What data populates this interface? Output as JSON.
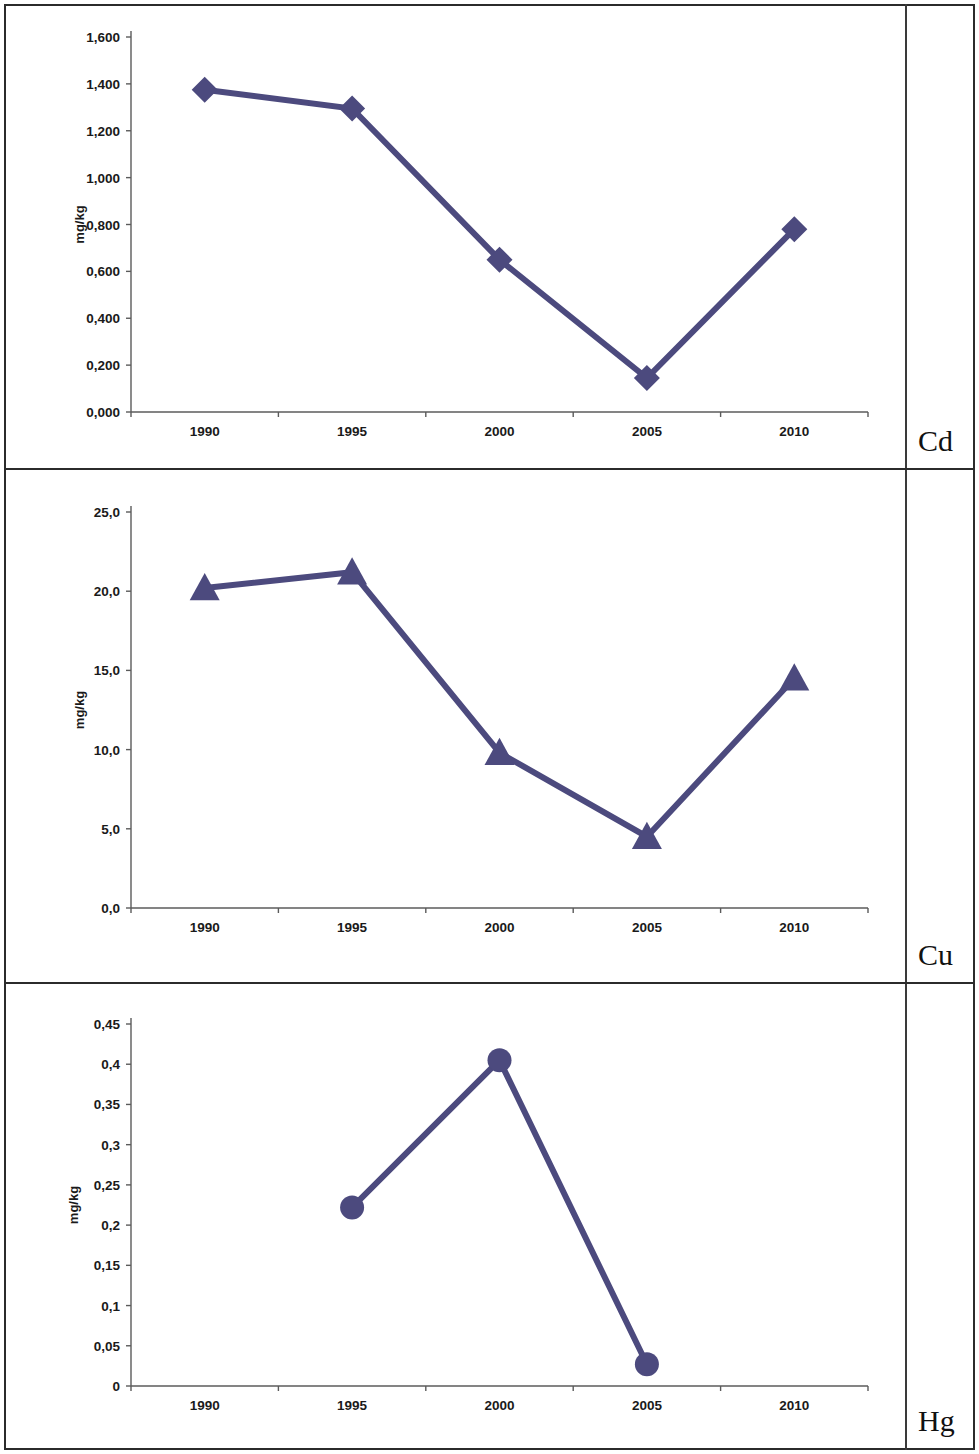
{
  "layout": {
    "accent_color": "#4c4a7e",
    "axis_color": "#5b5b5b",
    "border_color": "#2b2b2b",
    "row_labels": [
      {
        "name": "Cd"
      },
      {
        "name": "Cu"
      },
      {
        "name": "Hg"
      }
    ]
  },
  "chart_data": [
    {
      "type": "line",
      "title": "",
      "element": "Cd",
      "xlabel": "",
      "ylabel": "mg/kg",
      "marker": "diamond",
      "categories": [
        "1990",
        "1995",
        "2000",
        "2005",
        "2010"
      ],
      "x_ticklabels": [
        "1990",
        "1995",
        "2000",
        "2005",
        "2010"
      ],
      "y_ticklabels": [
        "0,000",
        "0,200",
        "0,400",
        "0,600",
        "0,800",
        "1,000",
        "1,200",
        "1,400",
        "1,600"
      ],
      "ylim": [
        0,
        1.6
      ],
      "ytick_step": 0.2,
      "values": [
        1.375,
        1.295,
        0.65,
        0.145,
        0.78
      ],
      "grid": false,
      "legend": "none"
    },
    {
      "type": "line",
      "title": "",
      "element": "Cu",
      "xlabel": "",
      "ylabel": "mg/kg",
      "marker": "triangle",
      "categories": [
        "1990",
        "1995",
        "2000",
        "2005",
        "2010"
      ],
      "x_ticklabels": [
        "1990",
        "1995",
        "2000",
        "2005",
        "2010"
      ],
      "y_ticklabels": [
        "0,0",
        "5,0",
        "10,0",
        "15,0",
        "20,0",
        "25,0"
      ],
      "ylim": [
        0,
        25
      ],
      "ytick_step": 5,
      "values": [
        20.2,
        21.2,
        9.8,
        4.5,
        14.5
      ],
      "grid": false,
      "legend": "none"
    },
    {
      "type": "line",
      "title": "",
      "element": "Hg",
      "xlabel": "",
      "ylabel": "mg/kg",
      "marker": "circle",
      "categories": [
        "1990",
        "1995",
        "2000",
        "2005",
        "2010"
      ],
      "x_ticklabels": [
        "1990",
        "1995",
        "2000",
        "2005",
        "2010"
      ],
      "y_ticklabels": [
        "0",
        "0,05",
        "0,1",
        "0,15",
        "0,2",
        "0,25",
        "0,3",
        "0,35",
        "0,4",
        "0,45"
      ],
      "ylim": [
        0,
        0.45
      ],
      "ytick_step": 0.05,
      "values": [
        null,
        0.222,
        0.405,
        0.027,
        null
      ],
      "grid": false,
      "legend": "none"
    }
  ]
}
